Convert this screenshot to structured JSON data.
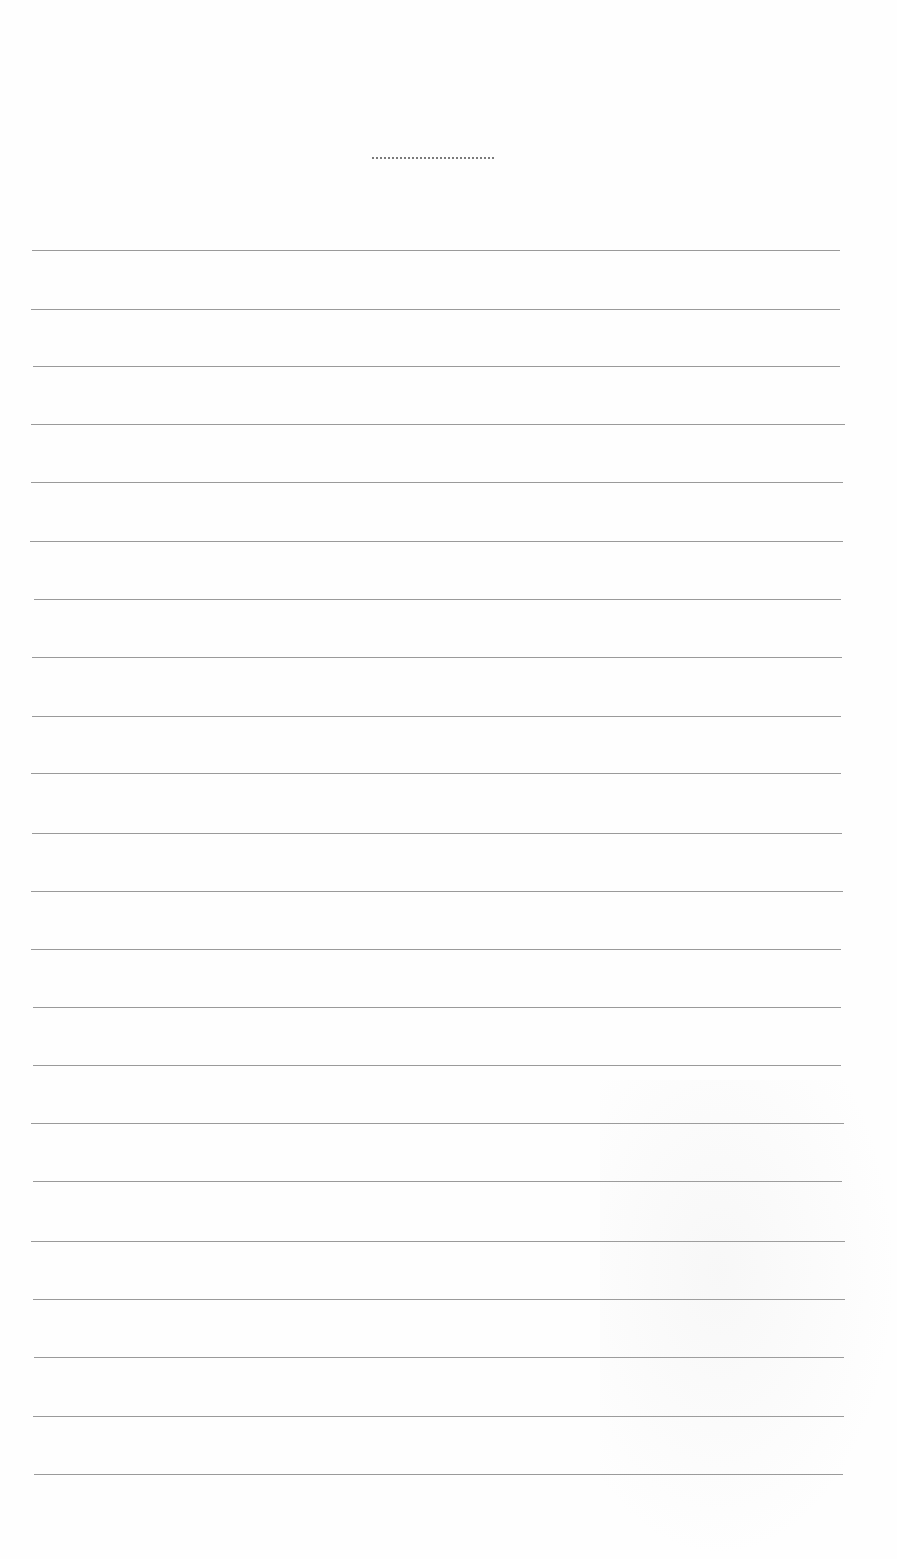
{
  "document": {
    "type": "blank lined sheet",
    "title_line": {
      "x": 372,
      "y": 157,
      "width": 122
    },
    "rules": [
      {
        "x": 32,
        "y": 250,
        "width": 808
      },
      {
        "x": 31,
        "y": 309,
        "width": 809
      },
      {
        "x": 33,
        "y": 366,
        "width": 807
      },
      {
        "x": 31,
        "y": 424,
        "width": 814
      },
      {
        "x": 31,
        "y": 482,
        "width": 812
      },
      {
        "x": 30,
        "y": 541,
        "width": 813
      },
      {
        "x": 34,
        "y": 599,
        "width": 807
      },
      {
        "x": 32,
        "y": 657,
        "width": 810
      },
      {
        "x": 32,
        "y": 716,
        "width": 809
      },
      {
        "x": 31,
        "y": 773,
        "width": 810
      },
      {
        "x": 32,
        "y": 833,
        "width": 810
      },
      {
        "x": 31,
        "y": 891,
        "width": 812
      },
      {
        "x": 31,
        "y": 949,
        "width": 810
      },
      {
        "x": 33,
        "y": 1007,
        "width": 808
      },
      {
        "x": 33,
        "y": 1065,
        "width": 808
      },
      {
        "x": 31,
        "y": 1123,
        "width": 813
      },
      {
        "x": 33,
        "y": 1181,
        "width": 809
      },
      {
        "x": 31,
        "y": 1241,
        "width": 814
      },
      {
        "x": 33,
        "y": 1299,
        "width": 812
      },
      {
        "x": 34,
        "y": 1357,
        "width": 810
      },
      {
        "x": 33,
        "y": 1416,
        "width": 811
      },
      {
        "x": 34,
        "y": 1474,
        "width": 809
      }
    ],
    "colors": {
      "paper": "#fefefe",
      "rule": "#9a9a9a",
      "title_line": "#7a7a7a"
    }
  }
}
